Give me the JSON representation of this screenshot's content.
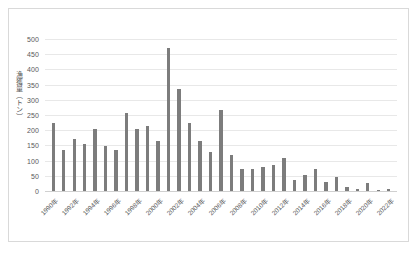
{
  "chart_data": {
    "type": "bar",
    "title": "",
    "xlabel": "",
    "ylabel": "漁獲量（トン）",
    "ylim": [
      0,
      500
    ],
    "ytick_step": 50,
    "yticks": [
      "500",
      "450",
      "400",
      "350",
      "300",
      "250",
      "200",
      "150",
      "100",
      "50",
      "0"
    ],
    "grid": true,
    "legend": "none",
    "bar_color": "#7c7c7c",
    "gridline_color": "#e8e8e8",
    "label_color": "#5a5a5a",
    "label_interval_years": 2,
    "categories": [
      "1990年",
      "1991年",
      "1992年",
      "1993年",
      "1994年",
      "1995年",
      "1996年",
      "1997年",
      "1998年",
      "1999年",
      "2000年",
      "2001年",
      "2002年",
      "2003年",
      "2004年",
      "2005年",
      "2006年",
      "2007年",
      "2008年",
      "2009年",
      "2010年",
      "2011年",
      "2012年",
      "2013年",
      "2014年",
      "2015年",
      "2016年",
      "2017年",
      "2018年",
      "2019年",
      "2020年",
      "2021年",
      "2022年"
    ],
    "values": [
      225,
      135,
      172,
      155,
      203,
      147,
      135,
      256,
      205,
      214,
      163,
      470,
      335,
      225,
      165,
      128,
      265,
      118,
      73,
      74,
      80,
      85,
      107,
      35,
      52,
      71,
      30,
      45,
      12,
      5,
      25,
      4,
      5
    ],
    "labeled_categories": [
      "1990年",
      "1992年",
      "1994年",
      "1996年",
      "1998年",
      "2000年",
      "2002年",
      "2004年",
      "2006年",
      "2008年",
      "2010年",
      "2012年",
      "2014年",
      "2016年",
      "2018年",
      "2020年",
      "2022年"
    ]
  }
}
